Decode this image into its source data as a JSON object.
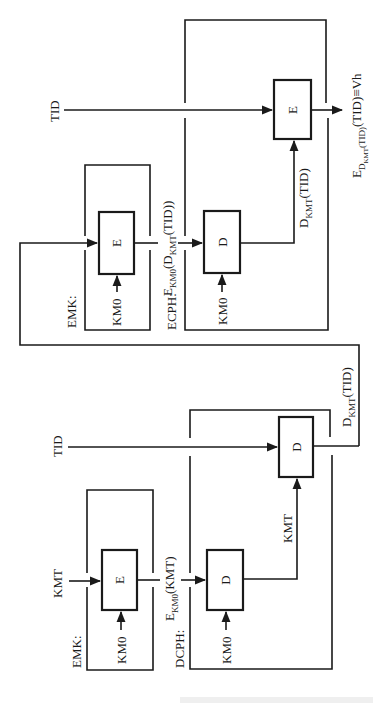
{
  "diagram": {
    "orientation": "rotated-90-ccw",
    "colors": {
      "line": "#1a1a1a",
      "background": "#ffffff"
    },
    "upper": {
      "emk_label": "EMK:",
      "ecph_label": "ECPH:",
      "tid_label": "TID",
      "emk_box_label": "E",
      "ecph_d_box_label": "D",
      "ecph_e_box_label": "E",
      "km0_label_1": "KM0",
      "km0_label_2": "KM0",
      "mid_label_main": "E",
      "mid_label_sub": "KM0",
      "mid_label_rest_1": "(D",
      "mid_label_sub2": "KMT",
      "mid_label_rest_2": "(TID))",
      "dkmt_main": "D",
      "dkmt_sub": "KMT",
      "dkmt_rest": "(TID)",
      "output_main": "E",
      "output_sub": "D",
      "output_subsub": "KMT",
      "output_sub_rest": "(TID)",
      "output_rest": "(TID)≡Vh"
    },
    "lower": {
      "emk_label": "EMK:",
      "dcph_label": "DCPH:",
      "kmt_input_label": "KMT",
      "tid_label": "TID",
      "emk_box_label": "E",
      "dcph_d_box_label": "D",
      "dcph_d2_box_label": "D",
      "km0_label_1": "KM0",
      "km0_label_2": "KM0",
      "kmt_mid_label": "KMT",
      "mid_label_main": "E",
      "mid_label_sub": "KM0",
      "mid_label_rest": "(KMT)",
      "dkmt_main": "D",
      "dkmt_sub": "KMT",
      "dkmt_rest": "(TID)"
    }
  }
}
